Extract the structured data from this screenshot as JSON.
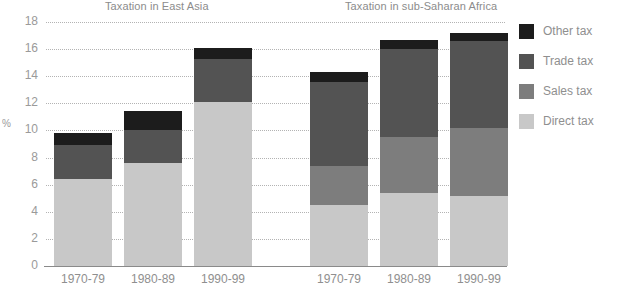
{
  "chart_data": {
    "type": "bar",
    "subtype": "stacked-bar",
    "title": "",
    "panels": [
      {
        "title": "Taxation in East Asia",
        "categories": [
          "1970-79",
          "1980-89",
          "1990-99"
        ]
      },
      {
        "title": "Taxation in sub-Saharan Africa",
        "categories": [
          "1970-79",
          "1980-89",
          "1990-99"
        ]
      }
    ],
    "categories": [
      "1970-79",
      "1980-89",
      "1990-99"
    ],
    "series": [
      {
        "name": "Direct tax",
        "color": "#c8c8c8",
        "values_east_asia": [
          6.4,
          7.6,
          12.1
        ],
        "values_africa": [
          4.5,
          5.4,
          5.2
        ]
      },
      {
        "name": "Sales tax",
        "color": "#7d7d7d",
        "values_east_asia": [
          0.0,
          0.0,
          0.0
        ],
        "values_africa": [
          2.9,
          4.1,
          5.0
        ]
      },
      {
        "name": "Trade tax",
        "color": "#535353",
        "values_east_asia": [
          2.5,
          2.4,
          3.2
        ],
        "values_africa": [
          6.2,
          6.5,
          6.4
        ]
      },
      {
        "name": "Other tax",
        "color": "#1c1c1c",
        "values_east_asia": [
          0.9,
          1.4,
          0.8
        ],
        "values_africa": [
          0.7,
          0.7,
          0.6
        ]
      }
    ],
    "totals": {
      "east_asia": [
        9.8,
        11.4,
        16.1
      ],
      "africa": [
        14.3,
        16.7,
        17.2
      ]
    },
    "xlabel": "",
    "ylabel": "%",
    "ylim": [
      0,
      18
    ],
    "yticks": [
      0,
      2,
      4,
      6,
      8,
      10,
      12,
      14,
      16,
      18
    ],
    "grid": true,
    "legend_position": "right"
  },
  "axis": {
    "y_label": "%",
    "y_ticks": [
      "18",
      "16",
      "14",
      "12",
      "10",
      "8",
      "6",
      "4",
      "2",
      "0"
    ]
  },
  "panels": {
    "east_asia": {
      "title": "Taxation in East Asia",
      "bars": [
        {
          "label": "1970-79",
          "segments": [
            {
              "name": "Direct tax",
              "value": 6.4,
              "color": "#c8c8c8"
            },
            {
              "name": "Sales tax",
              "value": 0.0,
              "color": "#7d7d7d"
            },
            {
              "name": "Trade tax",
              "value": 2.5,
              "color": "#535353"
            },
            {
              "name": "Other tax",
              "value": 0.9,
              "color": "#1c1c1c"
            }
          ]
        },
        {
          "label": "1980-89",
          "segments": [
            {
              "name": "Direct tax",
              "value": 7.6,
              "color": "#c8c8c8"
            },
            {
              "name": "Sales tax",
              "value": 0.0,
              "color": "#7d7d7d"
            },
            {
              "name": "Trade tax",
              "value": 2.4,
              "color": "#535353"
            },
            {
              "name": "Other tax",
              "value": 1.4,
              "color": "#1c1c1c"
            }
          ]
        },
        {
          "label": "1990-99",
          "segments": [
            {
              "name": "Direct tax",
              "value": 12.1,
              "color": "#c8c8c8"
            },
            {
              "name": "Sales tax",
              "value": 0.0,
              "color": "#7d7d7d"
            },
            {
              "name": "Trade tax",
              "value": 3.2,
              "color": "#535353"
            },
            {
              "name": "Other tax",
              "value": 0.8,
              "color": "#1c1c1c"
            }
          ]
        }
      ]
    },
    "africa": {
      "title": "Taxation in sub-Saharan Africa",
      "bars": [
        {
          "label": "1970-79",
          "segments": [
            {
              "name": "Direct tax",
              "value": 4.5,
              "color": "#c8c8c8"
            },
            {
              "name": "Sales tax",
              "value": 2.9,
              "color": "#7d7d7d"
            },
            {
              "name": "Trade tax",
              "value": 6.2,
              "color": "#535353"
            },
            {
              "name": "Other tax",
              "value": 0.7,
              "color": "#1c1c1c"
            }
          ]
        },
        {
          "label": "1980-89",
          "segments": [
            {
              "name": "Direct tax",
              "value": 5.4,
              "color": "#c8c8c8"
            },
            {
              "name": "Sales tax",
              "value": 4.1,
              "color": "#7d7d7d"
            },
            {
              "name": "Trade tax",
              "value": 6.5,
              "color": "#535353"
            },
            {
              "name": "Other tax",
              "value": 0.7,
              "color": "#1c1c1c"
            }
          ]
        },
        {
          "label": "1990-99",
          "segments": [
            {
              "name": "Direct tax",
              "value": 5.2,
              "color": "#c8c8c8"
            },
            {
              "name": "Sales tax",
              "value": 5.0,
              "color": "#7d7d7d"
            },
            {
              "name": "Trade tax",
              "value": 6.4,
              "color": "#535353"
            },
            {
              "name": "Other tax",
              "value": 0.6,
              "color": "#1c1c1c"
            }
          ]
        }
      ]
    }
  },
  "legend": {
    "items": [
      {
        "label": "Other tax",
        "color": "#1c1c1c"
      },
      {
        "label": "Trade tax",
        "color": "#535353"
      },
      {
        "label": "Sales tax",
        "color": "#7d7d7d"
      },
      {
        "label": "Direct tax",
        "color": "#c8c8c8"
      }
    ]
  },
  "colors": {
    "other_tax": "#1c1c1c",
    "trade_tax": "#535353",
    "sales_tax": "#7d7d7d",
    "direct_tax": "#c8c8c8",
    "gridline": "#b3b3b3",
    "axis": "#8a8a8a",
    "text": "#8f8f8f",
    "background": "#ffffff"
  }
}
